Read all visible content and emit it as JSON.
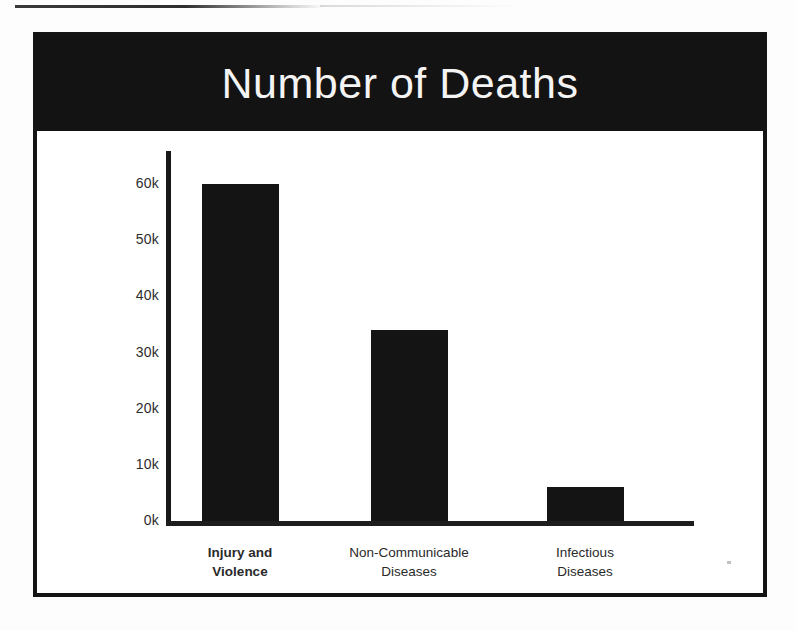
{
  "page": {
    "background_color": "#fdfdfd",
    "artifacts": {
      "top_scan_line": "scan-line-artifact",
      "speck": "dust-speck-artifact"
    }
  },
  "slide": {
    "frame_color": "#141414",
    "banner_color": "#131313",
    "banner_text_color": "#f4f4f4",
    "title": "Number of Deaths"
  },
  "chart_data": {
    "type": "bar",
    "title": "Number of Deaths",
    "xlabel": "",
    "ylabel": "",
    "categories": [
      "Injury and Violence",
      "Non-Communicable Diseases",
      "Infectious Diseases"
    ],
    "category_lines": [
      [
        "Injury and",
        "Violence"
      ],
      [
        "Non-Communicable",
        "Diseases"
      ],
      [
        "Infectious",
        "Diseases"
      ]
    ],
    "category_emphasis": [
      "bold",
      "normal",
      "normal"
    ],
    "values": [
      60000,
      34000,
      6000
    ],
    "value_labels": [
      "60k",
      "34k",
      "6k"
    ],
    "ylim": [
      0,
      65000
    ],
    "ytick_values": [
      0,
      10000,
      20000,
      30000,
      40000,
      50000,
      60000
    ],
    "ytick_labels": [
      "0k",
      "10k",
      "20k",
      "30k",
      "40k",
      "50k",
      "60k"
    ],
    "grid": false,
    "legend": false,
    "bar_color": "#141414",
    "axis_color": "#181818"
  }
}
